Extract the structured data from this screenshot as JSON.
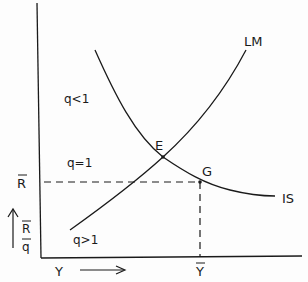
{
  "diagram": {
    "type": "IS-LM diagram",
    "curves": [
      {
        "id": "LM",
        "label": "LM"
      },
      {
        "id": "IS",
        "label": "IS"
      }
    ],
    "points": [
      {
        "id": "E",
        "label": "E"
      },
      {
        "id": "G",
        "label": "G"
      }
    ],
    "regions": {
      "q_lt_1": "q<1",
      "q_eq_1": "q=1",
      "q_gt_1": "q>1"
    },
    "y_axis": {
      "rbar_tick": "R",
      "arrow_label_top": "R",
      "arrow_label_bottom": "q"
    },
    "x_axis": {
      "label": "Y",
      "ybar_tick": "Y"
    },
    "colors": {
      "ink": "#1a1a1a",
      "background": "#fdfdfd"
    }
  }
}
